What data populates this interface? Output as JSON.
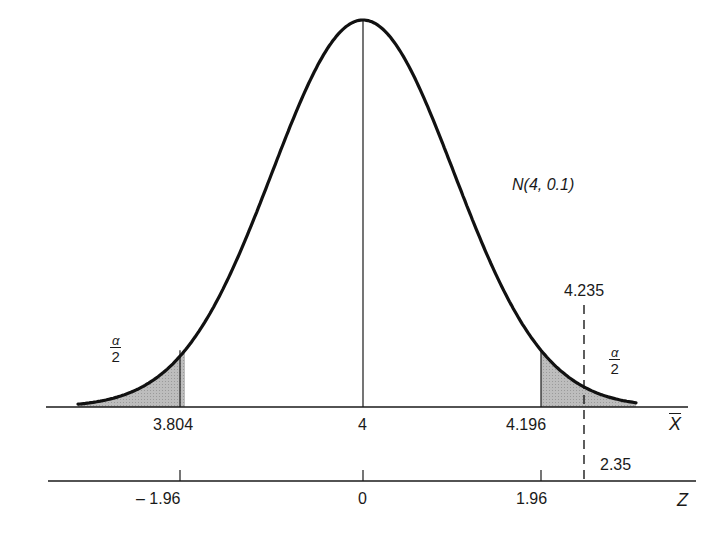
{
  "chart_data": {
    "type": "area",
    "title": "",
    "distribution_label": "N(4, 0.1)",
    "xlabel": "X̄",
    "zlabel": "Z",
    "x_axis": {
      "ticks": [
        3.804,
        4,
        4.196
      ],
      "tick_labels": [
        "3.804",
        "4",
        "4.196"
      ],
      "marker": {
        "value": 4.235,
        "label": "4.235",
        "style": "dashed"
      }
    },
    "z_axis": {
      "ticks": [
        -1.96,
        0,
        1.96
      ],
      "tick_labels": [
        "– 1.96",
        "0",
        "1.96"
      ],
      "marker": {
        "value": 2.35,
        "label": "2.35"
      }
    },
    "mean": 4,
    "std": 0.1,
    "shaded_regions": [
      {
        "from": "-inf",
        "to": 3.804,
        "label": "α/2"
      },
      {
        "from": 4.196,
        "to": "+inf",
        "label": "α/2"
      }
    ],
    "grid": false,
    "legend": "none"
  },
  "labels": {
    "dist": "N(4, 0.1)",
    "x_left": "3.804",
    "x_mid": "4",
    "x_right": "4.196",
    "x_marker": "4.235",
    "x_axis_name": "X",
    "z_left": "– 1.96",
    "z_mid": "0",
    "z_right": "1.96",
    "z_marker": "2.35",
    "z_axis_name": "Z",
    "alpha": "α",
    "two": "2"
  }
}
